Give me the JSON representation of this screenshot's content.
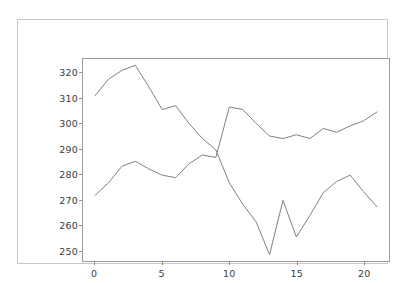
{
  "figure": {
    "background_color": "#ffffff",
    "frame_color": "#c9c9c9",
    "axes_color": "#9a9a9a",
    "tick_label_color": "#3b3b3b"
  },
  "chart_data": {
    "type": "line",
    "title": "",
    "xlabel": "",
    "ylabel": "",
    "xlim": [
      -0.9,
      21.9
    ],
    "ylim": [
      245.5,
      325.5
    ],
    "grid": false,
    "legend": "none",
    "xticks": [
      0,
      5,
      10,
      15,
      20
    ],
    "yticks": [
      250,
      260,
      270,
      280,
      290,
      300,
      310,
      320
    ],
    "line_color": "#808080",
    "line_width": 1,
    "series": [
      {
        "name": "series-1",
        "color": "#808080",
        "x": [
          0,
          1,
          2,
          3,
          4,
          5,
          6,
          7,
          8,
          9,
          10,
          11,
          12,
          13,
          14,
          15,
          16,
          17,
          18,
          19,
          20,
          21
        ],
        "values": [
          311.0,
          317.5,
          321.0,
          323.0,
          314.5,
          305.5,
          307.0,
          300.0,
          294.0,
          289.5,
          276.5,
          268.0,
          261.0,
          248.0,
          269.5,
          255.0,
          263.5,
          272.5,
          277.0,
          279.5,
          273.0,
          267.0
        ]
      },
      {
        "name": "series-2",
        "color": "#808080",
        "x": [
          0,
          1,
          2,
          3,
          4,
          5,
          6,
          7,
          8,
          9,
          10,
          11,
          12,
          13,
          14,
          15,
          16,
          17,
          18,
          19,
          20,
          21
        ],
        "values": [
          271.5,
          276.5,
          283.0,
          285.0,
          282.0,
          279.5,
          278.5,
          284.0,
          287.5,
          286.5,
          306.5,
          305.5,
          300.0,
          295.0,
          294.0,
          295.5,
          294.0,
          298.0,
          296.5,
          299.0,
          301.0,
          304.5
        ]
      }
    ],
    "series_pixel_paths": {
      "note": "series_1 is the descending/jagged trace drawn from its own left start; series_2 is the ascending trace"
    }
  },
  "axis": {
    "ytick_labels": [
      "320",
      "310",
      "300",
      "290",
      "280",
      "270",
      "260",
      "250"
    ],
    "xtick_labels": [
      "0",
      "5",
      "10",
      "15",
      "20"
    ]
  }
}
